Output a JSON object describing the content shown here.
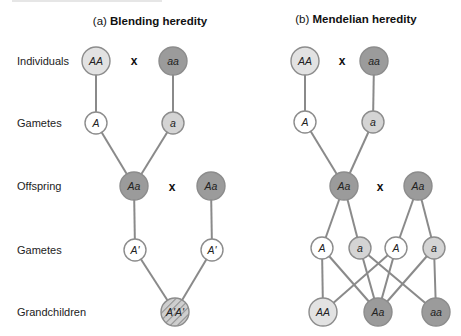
{
  "top_cutoff_text": "",
  "row_labels": [
    {
      "label": "Individuals",
      "y": 61
    },
    {
      "label": "Gametes",
      "y": 123
    },
    {
      "label": "Offspring",
      "y": 186
    },
    {
      "label": "Gametes",
      "y": 250
    },
    {
      "label": "Grandchildren",
      "y": 312
    }
  ],
  "colors": {
    "dominant_homozygous": "#e2e2e2",
    "recessive_gamete": "#d4d4d4",
    "dominant_gamete": "#ffffff",
    "dark": "#9b9b9b",
    "stroke": "#8c8c8c",
    "link": "#8a8a8a",
    "hatch_bg": "#cfcfcf",
    "hatch_line": "#8f8f8f"
  },
  "panels": [
    {
      "id": "blending",
      "prefix": "(a) ",
      "title": "Blending heredity",
      "title_x": 150,
      "nodes": [
        {
          "id": "l_AA",
          "label": "AA",
          "x": 96,
          "y": 61,
          "r": 14,
          "fill": "#e2e2e2"
        },
        {
          "id": "l_aa",
          "label": "aa",
          "x": 173,
          "y": 61,
          "r": 14,
          "fill": "#9b9b9b"
        },
        {
          "id": "l_gA",
          "label": "A",
          "x": 96,
          "y": 123,
          "r": 11,
          "fill": "#ffffff"
        },
        {
          "id": "l_ga",
          "label": "a",
          "x": 173,
          "y": 123,
          "r": 11,
          "fill": "#d4d4d4"
        },
        {
          "id": "l_Aa1",
          "label": "Aa",
          "x": 134,
          "y": 186,
          "r": 14,
          "fill": "#9b9b9b"
        },
        {
          "id": "l_Aa2",
          "label": "Aa",
          "x": 211,
          "y": 186,
          "r": 14,
          "fill": "#9b9b9b"
        },
        {
          "id": "l_gA1p",
          "label": "A'",
          "x": 135,
          "y": 250,
          "r": 11,
          "fill": "#ffffff"
        },
        {
          "id": "l_gA2p",
          "label": "A'",
          "x": 212,
          "y": 250,
          "r": 11,
          "fill": "#ffffff"
        },
        {
          "id": "l_ApAp",
          "label": "A'A'",
          "x": 175,
          "y": 312,
          "r": 14,
          "fill": "hatch"
        }
      ],
      "crosses": [
        {
          "label": "x",
          "x": 134,
          "y": 65
        },
        {
          "label": "x",
          "x": 172,
          "y": 191
        }
      ],
      "links": [
        [
          "l_AA",
          "l_gA"
        ],
        [
          "l_aa",
          "l_ga"
        ],
        [
          "l_gA",
          "l_Aa1"
        ],
        [
          "l_ga",
          "l_Aa1"
        ],
        [
          "l_Aa1",
          "l_gA1p"
        ],
        [
          "l_Aa2",
          "l_gA2p"
        ],
        [
          "l_gA1p",
          "l_ApAp"
        ],
        [
          "l_gA2p",
          "l_ApAp"
        ]
      ]
    },
    {
      "id": "mendelian",
      "prefix": "(b) ",
      "title": "Mendelian heredity",
      "title_x": 356,
      "nodes": [
        {
          "id": "r_AA",
          "label": "AA",
          "x": 305,
          "y": 61,
          "r": 14,
          "fill": "#e2e2e2"
        },
        {
          "id": "r_aa",
          "label": "aa",
          "x": 374,
          "y": 61,
          "r": 14,
          "fill": "#9b9b9b"
        },
        {
          "id": "r_gA",
          "label": "A",
          "x": 305,
          "y": 122,
          "r": 11,
          "fill": "#ffffff"
        },
        {
          "id": "r_ga",
          "label": "a",
          "x": 373,
          "y": 122,
          "r": 11,
          "fill": "#d4d4d4"
        },
        {
          "id": "r_Aa1",
          "label": "Aa",
          "x": 344,
          "y": 186,
          "r": 14,
          "fill": "#9b9b9b"
        },
        {
          "id": "r_Aa2",
          "label": "Aa",
          "x": 418,
          "y": 186,
          "r": 14,
          "fill": "#9b9b9b"
        },
        {
          "id": "r_g1",
          "label": "A",
          "x": 322,
          "y": 248,
          "r": 11,
          "fill": "#ffffff"
        },
        {
          "id": "r_g2",
          "label": "a",
          "x": 360,
          "y": 248,
          "r": 11,
          "fill": "#d4d4d4"
        },
        {
          "id": "r_g3",
          "label": "A",
          "x": 396,
          "y": 248,
          "r": 11,
          "fill": "#ffffff"
        },
        {
          "id": "r_g4",
          "label": "a",
          "x": 434,
          "y": 248,
          "r": 11,
          "fill": "#d4d4d4"
        },
        {
          "id": "r_cAA",
          "label": "AA",
          "x": 323,
          "y": 312,
          "r": 14,
          "fill": "#e2e2e2"
        },
        {
          "id": "r_cAa",
          "label": "Aa",
          "x": 378,
          "y": 312,
          "r": 14,
          "fill": "#9b9b9b"
        },
        {
          "id": "r_caa",
          "label": "aa",
          "x": 436,
          "y": 312,
          "r": 14,
          "fill": "#9b9b9b"
        }
      ],
      "crosses": [
        {
          "label": "x",
          "x": 342,
          "y": 65
        },
        {
          "label": "x",
          "x": 380,
          "y": 191
        }
      ],
      "links": [
        [
          "r_AA",
          "r_gA"
        ],
        [
          "r_aa",
          "r_ga"
        ],
        [
          "r_gA",
          "r_Aa1"
        ],
        [
          "r_ga",
          "r_Aa1"
        ],
        [
          "r_Aa1",
          "r_g1"
        ],
        [
          "r_Aa1",
          "r_g2"
        ],
        [
          "r_Aa2",
          "r_g3"
        ],
        [
          "r_Aa2",
          "r_g4"
        ],
        [
          "r_g1",
          "r_cAA"
        ],
        [
          "r_g1",
          "r_cAa"
        ],
        [
          "r_g2",
          "r_cAa"
        ],
        [
          "r_g2",
          "r_caa"
        ],
        [
          "r_g3",
          "r_cAA"
        ],
        [
          "r_g3",
          "r_cAa"
        ],
        [
          "r_g4",
          "r_cAa"
        ],
        [
          "r_g4",
          "r_caa"
        ]
      ]
    }
  ]
}
